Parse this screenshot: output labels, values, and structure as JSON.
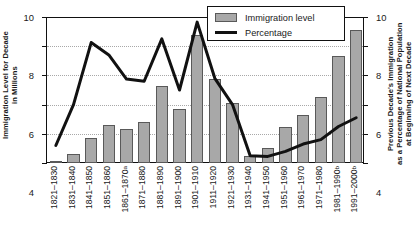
{
  "axes": {
    "left_title": "Immigration Level for Decade\nin Millions",
    "right_title": "Previous Decade's Immigration\nas a Percentage of National Population\nat Beginning of Next Decade",
    "left_ticks": [
      "10",
      "8",
      "6",
      "4",
      "2",
      "0"
    ],
    "right_ticks": [
      "10",
      "8",
      "6",
      "4",
      "2",
      "0"
    ]
  },
  "legend": {
    "bar_label": "Immigration level",
    "line_label": "Percentage",
    "bar_color": "#a8a8a8",
    "line_color": "#111111"
  },
  "chart_data": {
    "type": "bar",
    "title": "",
    "xlabel": "",
    "ylabel": "Immigration Level for Decade in Millions",
    "y2label": "Previous Decade's Immigration as a Percentage of National Population at Beginning of Next Decade",
    "ylim": [
      0,
      10
    ],
    "y2lim": [
      0,
      10
    ],
    "grid": true,
    "legend_position": "top-right",
    "categories": [
      "1821–1830",
      "1831–1840",
      "1841–1850",
      "1851–1860",
      "1861–1870",
      "1871–1880",
      "1881–1890",
      "1891–1900",
      "1901–1910",
      "1911–1920",
      "1921–1930",
      "1931–1940",
      "1941–1950",
      "1951–1960",
      "1961–1970",
      "1971–1980",
      "1981–1990",
      "1991–2000"
    ],
    "category_superscripts": [
      "",
      "",
      "",
      "",
      "a",
      "",
      "",
      "",
      "",
      "",
      "",
      "",
      "",
      "",
      "",
      "",
      "b",
      "b"
    ],
    "series": [
      {
        "name": "Immigration level",
        "type": "bar",
        "axis": "left",
        "units": "millions",
        "values": [
          0.15,
          0.6,
          1.7,
          2.6,
          2.3,
          2.8,
          5.25,
          3.7,
          8.8,
          5.75,
          4.1,
          0.5,
          1.0,
          2.5,
          3.3,
          4.5,
          7.3,
          9.1
        ]
      },
      {
        "name": "Percentage",
        "type": "line",
        "axis": "right",
        "units": "percent",
        "values": [
          1.2,
          4.0,
          8.25,
          7.4,
          5.75,
          5.6,
          8.5,
          5.0,
          9.65,
          5.8,
          4.0,
          0.5,
          0.45,
          0.8,
          1.3,
          1.6,
          2.5,
          3.1
        ]
      }
    ]
  }
}
